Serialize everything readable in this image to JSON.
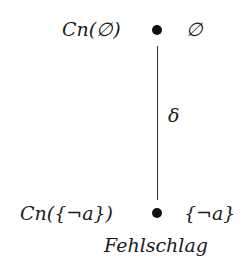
{
  "diagram": {
    "type": "hasse-path",
    "nodes": [
      {
        "id": "top",
        "left_label": "Cn(∅)",
        "right_label": "∅"
      },
      {
        "id": "bottom",
        "left_label": "Cn({¬a})",
        "right_label": "{¬a}",
        "caption": "Fehlschlag"
      }
    ],
    "edges": [
      {
        "from": "top",
        "to": "bottom",
        "label": "δ"
      }
    ],
    "colors": {
      "ink": "#1a1a1a",
      "node": "#111111",
      "edge": "#333333",
      "background": "#ffffff"
    }
  }
}
